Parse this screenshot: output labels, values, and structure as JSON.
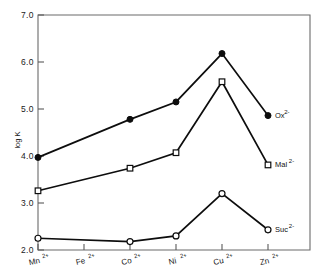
{
  "chart_data": {
    "type": "line",
    "title": "",
    "xlabel": "",
    "ylabel": "log K",
    "ylim": [
      2.0,
      7.0
    ],
    "ytick_labels": [
      "7.0",
      "6.0",
      "5.0",
      "4.0",
      "3.0",
      "2.0"
    ],
    "ytick_values": [
      7.0,
      6.0,
      5.0,
      4.0,
      3.0,
      2.0
    ],
    "categories": [
      "Mn",
      "Fe",
      "Co",
      "Ni",
      "Cu",
      "Zn"
    ],
    "category_charge": "2+",
    "grid": false,
    "legend_position": "right-inline",
    "series": [
      {
        "name": "Ox",
        "charge": "2-",
        "label": "Ox",
        "label_sup": "2-",
        "marker": "filled-circle",
        "x": [
          "Mn",
          "Co",
          "Ni",
          "Cu",
          "Zn"
        ],
        "values": [
          3.97,
          4.78,
          5.15,
          6.18,
          4.86
        ]
      },
      {
        "name": "Mal",
        "charge": "2-",
        "label": "Mal",
        "label_sup": "2-",
        "marker": "open-square",
        "x": [
          "Mn",
          "Co",
          "Ni",
          "Cu",
          "Zn"
        ],
        "values": [
          3.26,
          3.74,
          4.07,
          5.58,
          3.81
        ]
      },
      {
        "name": "Suc",
        "charge": "2-",
        "label": "Suc",
        "label_sup": "2-",
        "marker": "open-circle",
        "x": [
          "Mn",
          "Co",
          "Ni",
          "Cu",
          "Zn"
        ],
        "values": [
          2.25,
          2.18,
          2.3,
          3.2,
          2.43
        ]
      }
    ]
  },
  "axes": {
    "y_title": "log K"
  }
}
